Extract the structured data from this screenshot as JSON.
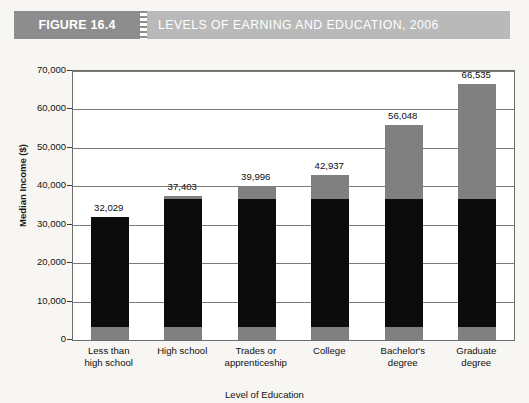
{
  "header": {
    "figure_tag": "FIGURE 16.4",
    "title": "LEVELS OF EARNING AND EDUCATION, 2006",
    "tag_bg": "#8d8d8d",
    "band_bg": "#b9b9b9",
    "text_color": "#ffffff"
  },
  "chart_data": {
    "type": "bar",
    "title": "LEVELS OF EARNING AND EDUCATION, 2006",
    "xlabel": "Level of Education",
    "ylabel": "Median Income ($)",
    "ylim": [
      0,
      70000
    ],
    "ytick_labels": [
      "70,000",
      "60,000",
      "50,000",
      "40,000",
      "30,000",
      "20,000",
      "10,000",
      "0"
    ],
    "ytick_values": [
      70000,
      60000,
      50000,
      40000,
      30000,
      20000,
      10000,
      0
    ],
    "grid": true,
    "legend": "none",
    "categories": [
      "Less than\nhigh school",
      "High school",
      "Trades or\napprenticeship",
      "College",
      "Bachelor's\ndegree",
      "Graduate\ndegree"
    ],
    "values": [
      32029,
      37403,
      39996,
      42937,
      56048,
      66535
    ],
    "data_labels": [
      "32,029",
      "37,403",
      "39,996",
      "42,937",
      "56,048",
      "66,535"
    ],
    "bar_fill_black": "#0c0c0c",
    "bar_fill_gray": "#808080",
    "black_segment_top": 36800,
    "gray_base_segment_top": 3500
  }
}
